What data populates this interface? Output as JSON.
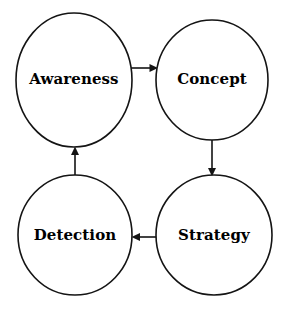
{
  "diagram": {
    "type": "cycle-flow-diagram",
    "title": "",
    "background_color": "#ffffff",
    "stroke_color": "#141414",
    "text_color": "#000000",
    "nodes": [
      {
        "id": "awareness",
        "label": "Awareness",
        "cx": 74,
        "cy": 80,
        "rx": 58,
        "ry": 67
      },
      {
        "id": "concept",
        "label": "Concept",
        "cx": 212,
        "cy": 80,
        "rx": 56,
        "ry": 60
      },
      {
        "id": "strategy",
        "label": "Strategy",
        "cx": 214,
        "cy": 235,
        "rx": 58,
        "ry": 60
      },
      {
        "id": "detection",
        "label": "Detection",
        "cx": 75,
        "cy": 235,
        "rx": 57,
        "ry": 60
      }
    ],
    "edges": [
      {
        "id": "awareness-to-concept",
        "from": "awareness",
        "to": "concept",
        "direction": "right",
        "label": ""
      },
      {
        "id": "concept-to-strategy",
        "from": "concept",
        "to": "strategy",
        "direction": "down",
        "label": ""
      },
      {
        "id": "strategy-to-detection",
        "from": "strategy",
        "to": "detection",
        "direction": "left",
        "label": ""
      },
      {
        "id": "detection-to-awareness",
        "from": "detection",
        "to": "awareness",
        "direction": "up",
        "label": ""
      }
    ]
  }
}
